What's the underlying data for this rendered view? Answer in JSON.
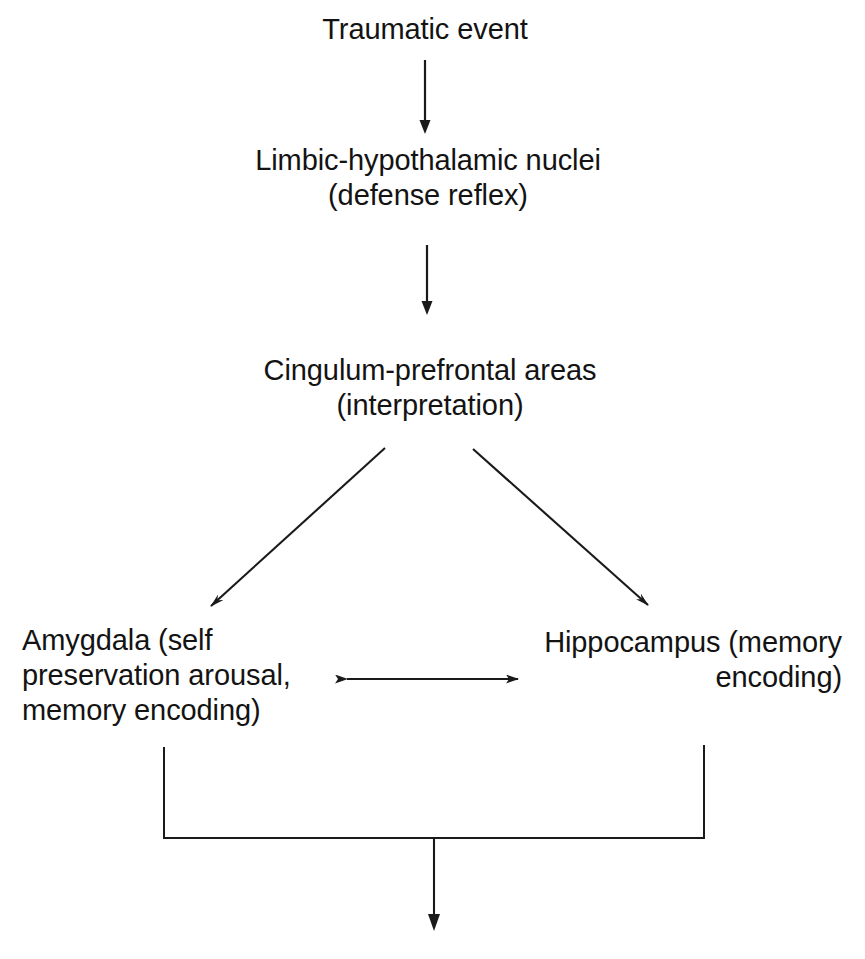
{
  "diagram": {
    "background_color": "#ffffff",
    "line_color": "#1a1a1a",
    "text_color": "#131313",
    "nodes": [
      {
        "id": "traumatic-event",
        "label": "Traumatic event",
        "align": "center"
      },
      {
        "id": "limbic-hypothalamic-nuclei",
        "label": "Limbic-hypothalamic nuclei\n(defense reflex)",
        "align": "center"
      },
      {
        "id": "cingulum-prefrontal-areas",
        "label": "Cingulum-prefrontal areas\n(interpretation)",
        "align": "center"
      },
      {
        "id": "amygdala",
        "label": "Amygdala (self\npreservation arousal,\nmemory encoding)",
        "align": "left"
      },
      {
        "id": "hippocampus",
        "label": "Hippocampus (memory\nencoding)",
        "align": "right"
      }
    ],
    "connectors": [
      {
        "id": "arrow-trauma-to-limbic",
        "type": "arrow-vertical-down",
        "from": "traumatic-event",
        "to": "limbic-hypothalamic-nuclei"
      },
      {
        "id": "arrow-limbic-to-cingulum",
        "type": "arrow-vertical-down",
        "from": "limbic-hypothalamic-nuclei",
        "to": "cingulum-prefrontal-areas"
      },
      {
        "id": "arrow-cingulum-to-amygdala",
        "type": "arrow-diagonal-down-left",
        "from": "cingulum-prefrontal-areas",
        "to": "amygdala"
      },
      {
        "id": "arrow-cingulum-to-hippocampus",
        "type": "arrow-diagonal-down-right",
        "from": "cingulum-prefrontal-areas",
        "to": "hippocampus"
      },
      {
        "id": "arrow-amygdala-hippocampus-bidirectional",
        "type": "arrow-bidirectional-horizontal",
        "from": "amygdala",
        "to": "hippocampus"
      },
      {
        "id": "bracket-join-to-outcome",
        "type": "bracket-join-with-arrow-down",
        "from": "amygdala, hippocampus",
        "to": "(continues below figure)"
      }
    ]
  }
}
